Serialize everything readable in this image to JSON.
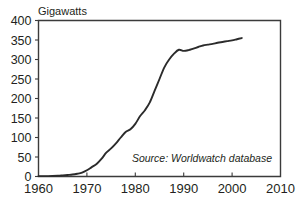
{
  "chart_data": {
    "type": "line",
    "title": "",
    "ylabel": "Gigawatts",
    "xlabel": "",
    "xlim": [
      1960,
      2010
    ],
    "ylim": [
      0,
      400
    ],
    "grid": false,
    "legend": false,
    "annotation": "Source: Worldwatch database",
    "xticks": [
      "1960",
      "1970",
      "1980",
      "1990",
      "2000",
      "2010"
    ],
    "xtick_values": [
      1960,
      1970,
      1980,
      1990,
      2000,
      2010
    ],
    "yticks": [
      "0",
      "50",
      "100",
      "150",
      "200",
      "250",
      "300",
      "350",
      "400"
    ],
    "ytick_values": [
      0,
      50,
      100,
      150,
      200,
      250,
      300,
      350,
      400
    ],
    "series": [
      {
        "name": "Installed capacity",
        "x": [
          1960,
          1962,
          1964,
          1965,
          1966,
          1967,
          1968,
          1969,
          1970,
          1971,
          1972,
          1973,
          1974,
          1975,
          1976,
          1977,
          1978,
          1979,
          1980,
          1981,
          1982,
          1983,
          1984,
          1985,
          1986,
          1987,
          1988,
          1989,
          1990,
          1991,
          1992,
          1993,
          1994,
          1995,
          1996,
          1997,
          1998,
          1999,
          2000,
          2001,
          2002
        ],
        "values": [
          1,
          1,
          2,
          3,
          4,
          5,
          7,
          10,
          16,
          24,
          32,
          45,
          61,
          72,
          85,
          100,
          114,
          121,
          135,
          155,
          170,
          190,
          220,
          250,
          280,
          300,
          315,
          325,
          322,
          324,
          328,
          332,
          336,
          338,
          340,
          343,
          345,
          347,
          349,
          352,
          355
        ]
      }
    ]
  },
  "figure": {
    "background_color": "#ffffff",
    "line_color": "#2b2b2b",
    "axis_color": "#3b3b3b",
    "text_color": "#231f20"
  }
}
